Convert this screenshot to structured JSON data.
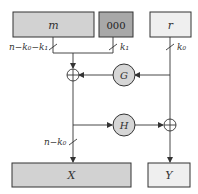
{
  "diagram": {
    "colors": {
      "m_fill": "#d2d2d2",
      "zeros_fill": "#a8a8a8",
      "r_fill": "#efefef",
      "x_fill": "#d2d2d2",
      "y_fill": "#efefef",
      "fn_fill": "#d6d6d6",
      "stroke": "#333333"
    },
    "boxes": {
      "m": {
        "label": "m"
      },
      "zeros": {
        "label": "000"
      },
      "r": {
        "label": "r"
      },
      "x": {
        "label": "X"
      },
      "y": {
        "label": "Y"
      }
    },
    "functions": {
      "g": {
        "label": "G"
      },
      "h": {
        "label": "H"
      }
    },
    "bit_widths": {
      "m_width": "n−k₀−k₁",
      "zeros_width": "k₁",
      "r_width": "k₀",
      "x_width": "n−k₀"
    }
  }
}
